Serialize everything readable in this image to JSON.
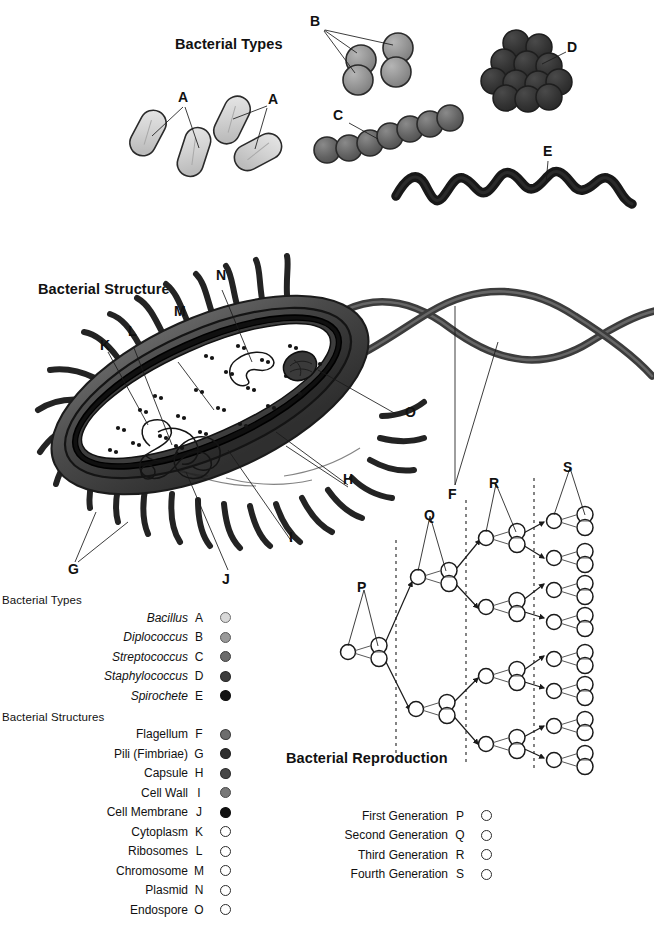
{
  "page": {
    "background": "#ffffff",
    "width": 654,
    "height": 932
  },
  "sections": {
    "types_title": "Bacterial Types",
    "structure_title": "Bacterial Structure",
    "reproduction_title": "Bacterial Reproduction"
  },
  "callouts": {
    "a1": "A",
    "a2": "A",
    "b": "B",
    "c": "C",
    "d": "D",
    "e": "E",
    "f": "F",
    "g": "G",
    "h": "H",
    "i": "I",
    "j": "J",
    "k": "K",
    "l": "L",
    "m": "M",
    "n": "N",
    "o": "O",
    "p": "P",
    "q": "Q",
    "r": "R",
    "s": "S"
  },
  "legend": {
    "types_heading": "Bacterial Types",
    "types": [
      {
        "name": "Bacillus",
        "key": "A",
        "italic": true,
        "color": "#d9d9d9",
        "stroke": "#6e6e6e",
        "shape": "circle"
      },
      {
        "name": "Diplococcus",
        "key": "B",
        "italic": true,
        "color": "#9a9a9a",
        "stroke": "#595959",
        "shape": "circle"
      },
      {
        "name": "Streptococcus",
        "key": "C",
        "italic": true,
        "color": "#6b6b6b",
        "stroke": "#3f3f3f",
        "shape": "circle"
      },
      {
        "name": "Staphylococcus",
        "key": "D",
        "italic": true,
        "color": "#3c3c3c",
        "stroke": "#262626",
        "shape": "blob"
      },
      {
        "name": "Spirochete",
        "key": "E",
        "italic": true,
        "color": "#141414",
        "stroke": "#0d0d0d",
        "shape": "blob"
      }
    ],
    "structures_heading": "Bacterial Structures",
    "structures": [
      {
        "name": "Flagellum",
        "key": "F",
        "italic": false,
        "color": "#6d6d6d",
        "stroke": "#3b3b3b",
        "shape": "blob"
      },
      {
        "name": "Pili (Fimbriae)",
        "key": "G",
        "italic": false,
        "color": "#2e2e2e",
        "stroke": "#1e1e1e",
        "shape": "blob"
      },
      {
        "name": "Capsule",
        "key": "H",
        "italic": false,
        "color": "#474747",
        "stroke": "#2b2b2b",
        "shape": "blob"
      },
      {
        "name": "Cell Wall",
        "key": "I",
        "italic": false,
        "color": "#787878",
        "stroke": "#4a4a4a",
        "shape": "circle"
      },
      {
        "name": "Cell Membrane",
        "key": "J",
        "italic": false,
        "color": "#111111",
        "stroke": "#0a0a0a",
        "shape": "blob"
      },
      {
        "name": "Cytoplasm",
        "key": "K",
        "italic": false,
        "color": "#ffffff",
        "stroke": "#2b2b2b",
        "shape": "hollow"
      },
      {
        "name": "Ribosomes",
        "key": "L",
        "italic": false,
        "color": "#ffffff",
        "stroke": "#2b2b2b",
        "shape": "hollow"
      },
      {
        "name": "Chromosome",
        "key": "M",
        "italic": false,
        "color": "#ffffff",
        "stroke": "#2b2b2b",
        "shape": "hollow"
      },
      {
        "name": "Plasmid",
        "key": "N",
        "italic": false,
        "color": "#ffffff",
        "stroke": "#2b2b2b",
        "shape": "hollow"
      },
      {
        "name": "Endospore",
        "key": "O",
        "italic": false,
        "color": "#ffffff",
        "stroke": "#2b2b2b",
        "shape": "hollow"
      }
    ],
    "generations": [
      {
        "name": "First Generation",
        "key": "P",
        "color": "#ffffff",
        "stroke": "#2b2b2b"
      },
      {
        "name": "Second Generation",
        "key": "Q",
        "color": "#ffffff",
        "stroke": "#2b2b2b"
      },
      {
        "name": "Third Generation",
        "key": "R",
        "color": "#ffffff",
        "stroke": "#2b2b2b"
      },
      {
        "name": "Fourth Generation",
        "key": "S",
        "color": "#ffffff",
        "stroke": "#2b2b2b"
      }
    ]
  },
  "colors": {
    "ink": "#111111",
    "leader": "#1a1a1a",
    "cell_fill_light": "#d9d9d9",
    "cell_fill_mid": "#6b6b6b",
    "cell_fill_dark": "#2e2e2e",
    "capsule": "#4d4d4d",
    "flagellum": "#5a5a5a",
    "pili": "#262626",
    "cytoplasm": "#ffffff",
    "divider_dash": "#333333"
  }
}
